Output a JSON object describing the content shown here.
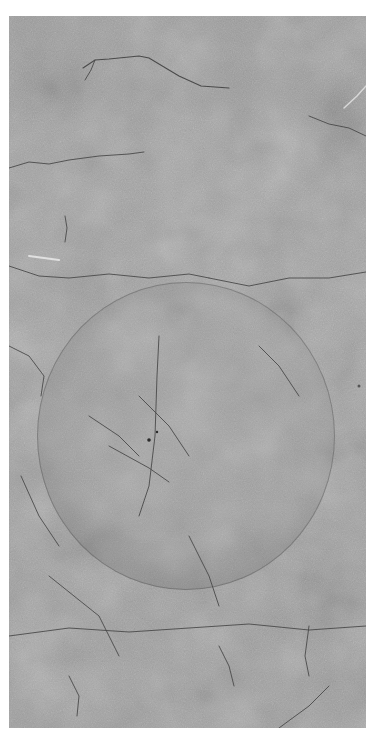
{
  "image": {
    "description": "Grayscale photo of a cracked concrete surface with a circular mug-ring stain",
    "subject": "concrete texture with circle stain",
    "colors": {
      "base_gray": "#a0a0a0",
      "ring_gray": "#8a8a8a",
      "crack": "#4a4a4a",
      "background": "#ffffff"
    },
    "circle": {
      "center_x": 186,
      "center_y": 436,
      "radius": 150
    }
  }
}
